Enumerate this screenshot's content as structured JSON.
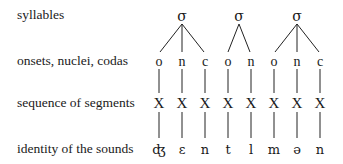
{
  "rows": {
    "syllables": "syllables",
    "constituents": "onsets, nuclei, codas",
    "segments": "sequence of segments",
    "sounds": "identity of the sounds"
  },
  "syllables": [
    {
      "symbol": "σ",
      "children": [
        "o",
        "n",
        "c"
      ]
    },
    {
      "symbol": "σ",
      "children": [
        "o",
        "n"
      ]
    },
    {
      "symbol": "σ",
      "children": [
        "o",
        "n",
        "c"
      ]
    }
  ],
  "constituents": [
    "o",
    "n",
    "c",
    "o",
    "n",
    "o",
    "n",
    "c"
  ],
  "segments": [
    "X",
    "X",
    "X",
    "X",
    "X",
    "X",
    "X",
    "X"
  ],
  "sounds": [
    "ʤ",
    "ɛ",
    "n",
    "t",
    "l",
    "m",
    "ə",
    "n"
  ]
}
